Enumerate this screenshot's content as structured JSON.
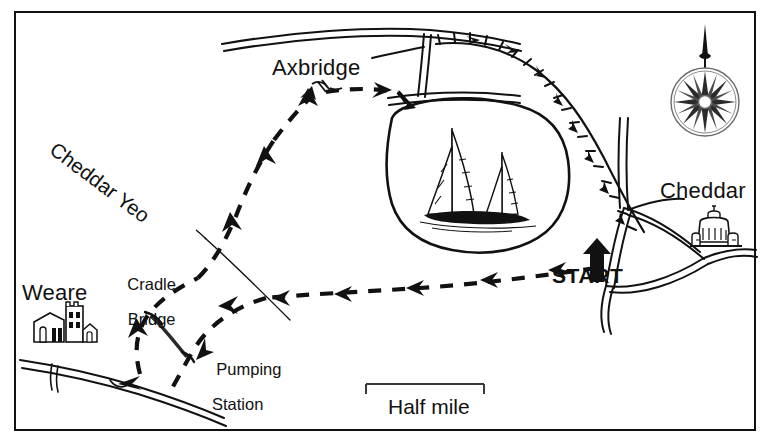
{
  "map": {
    "title": "Cheddar Reservoir circular walk map",
    "style": "hand-drawn sketch map, black ink on white",
    "frame_color": "#111111",
    "background_color": "#ffffff",
    "ink_color": "#111111"
  },
  "labels": {
    "axbridge": "Axbridge",
    "cheddar": "Cheddar",
    "weare": "Weare",
    "cradle_bridge_line1": "Cradle",
    "cradle_bridge_line2": "Bridge",
    "pumping_line1": "Pumping",
    "pumping_line2": "Station",
    "start": "START",
    "river": "Cheddar Yeo"
  },
  "scale": {
    "caption": "Half mile",
    "bar_length_px": 118
  },
  "compass": {
    "name": "compass-rose",
    "rays": 16,
    "needle_direction": "north"
  },
  "icons": {
    "weare_church": "church-icon",
    "cheddar_church": "church-icon",
    "sailboats": "sailboat-icon",
    "start_arrow": "up-arrow-icon"
  },
  "features": {
    "reservoir": "Cheddar Reservoir",
    "boats_count": 2,
    "route_style": "dashed with direction arrows",
    "footpath_style": "tick-hatched hedge line",
    "road_style": "double outline"
  }
}
